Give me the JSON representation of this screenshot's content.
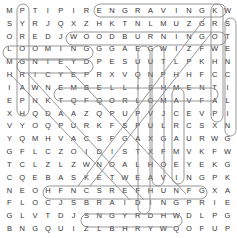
{
  "puzzle": {
    "rows": [
      "MPTIPIRENGRAVINGKW",
      "SYRJQXZHKTNLMUZGRS",
      "OREDJWOODBURNINGOT",
      "LOOMINGGGAEGWIZFWE",
      "MGNIEYDPESUUTLPKHN",
      "HRICYEPRXVQNPHHFCC",
      "IAWNEMBELLISHMENTI",
      "EPNKTQFQORLOMAVFAL",
      "XHQDAAZQPUPVJCEVPI",
      "VYOQPURKFSPULRCSXN",
      "YQMHVACSFGAXGAURWG",
      "GFLCZOIDISTXFMVKFW",
      "TCLZLZWNOALHOEYEKG",
      "CQEBASKETWEAVINGPK",
      "NEOHFNCSREFHUNFGXA",
      "FLOCJSBRAIDINGPRIE",
      "GLVTDJSNGYRDHWDLPG",
      "BNGQUIZLBHRYWQOFUP"
    ],
    "found_words": [
      "ENGRAVING",
      "WOODBURNING",
      "LOOMING",
      "DYEING",
      "EMBELLISHMENT",
      "BASKETWEAVING",
      "BRAIDING",
      "STENCILING",
      "KROWHCTAP",
      "PYROGRAPHY",
      "MACRAME",
      "EUQ",
      "TAP"
    ],
    "highlight_color": "#888888"
  }
}
